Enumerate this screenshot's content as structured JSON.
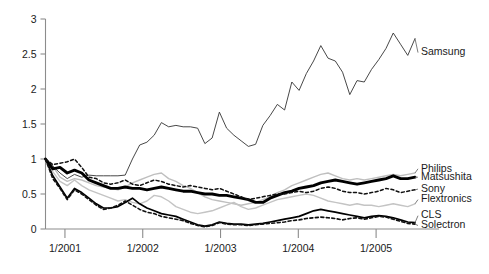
{
  "chart_data": {
    "type": "line",
    "title": "",
    "subtitle": "",
    "xlabel": "",
    "ylabel": "",
    "xlim": [
      "10/2000",
      "7/2005"
    ],
    "ylim": [
      0,
      3
    ],
    "grid": false,
    "legend_position": "right-inline-labels",
    "x_tick_labels": [
      "1/2001",
      "1/2002",
      "1/2003",
      "1/2004",
      "1/2005"
    ],
    "x_tick_values": [
      0.25,
      1.25,
      2.25,
      3.25,
      4.25
    ],
    "y_tick_labels": [
      "0",
      "0.5",
      "1",
      "1.5",
      "2",
      "2.5",
      "3"
    ],
    "y_tick_values": [
      0,
      0.5,
      1,
      1.5,
      2,
      2.5,
      3
    ],
    "x_start": 0,
    "x_end": 4.75,
    "note": "Indexed share price, normalized to 1.0 at start (late 2000). Monthly observations.",
    "series": [
      {
        "name": "Samsung",
        "label": "Samsung",
        "style": "thin-solid",
        "color": "#333333",
        "width": 0.9,
        "dash": "none",
        "label_y": 2.52,
        "values": [
          1.0,
          0.9,
          0.8,
          0.72,
          0.78,
          0.74,
          0.77,
          0.76,
          0.76,
          0.76,
          0.76,
          0.77,
          1.0,
          1.2,
          1.24,
          1.34,
          1.52,
          1.46,
          1.48,
          1.46,
          1.46,
          1.44,
          1.22,
          1.3,
          1.67,
          1.44,
          1.34,
          1.26,
          1.18,
          1.21,
          1.48,
          1.62,
          1.78,
          1.7,
          2.1,
          1.98,
          2.22,
          2.4,
          2.62,
          2.44,
          2.4,
          2.24,
          1.92,
          2.12,
          2.1,
          2.28,
          2.42,
          2.58,
          2.8,
          2.64,
          2.48,
          2.72
        ]
      },
      {
        "name": "Philips",
        "label": "Philips",
        "style": "light-gray-solid",
        "color": "#bfbfbf",
        "width": 1.4,
        "dash": "none",
        "label_y": 0.86,
        "values": [
          1.0,
          0.9,
          0.74,
          0.68,
          0.72,
          0.7,
          0.66,
          0.62,
          0.6,
          0.58,
          0.56,
          0.6,
          0.66,
          0.7,
          0.74,
          0.78,
          0.8,
          0.72,
          0.68,
          0.62,
          0.58,
          0.52,
          0.46,
          0.42,
          0.4,
          0.38,
          0.36,
          0.34,
          0.36,
          0.38,
          0.42,
          0.46,
          0.52,
          0.56,
          0.62,
          0.66,
          0.7,
          0.74,
          0.78,
          0.8,
          0.76,
          0.72,
          0.7,
          0.72,
          0.7,
          0.72,
          0.74,
          0.76,
          0.78,
          0.76,
          0.78,
          0.8
        ]
      },
      {
        "name": "Matsushita",
        "label": "Matsushita",
        "style": "thick-black-solid",
        "color": "#000000",
        "width": 2.9,
        "dash": "none",
        "label_y": 0.74,
        "values": [
          1.0,
          0.86,
          0.88,
          0.8,
          0.84,
          0.8,
          0.7,
          0.66,
          0.62,
          0.58,
          0.58,
          0.6,
          0.58,
          0.58,
          0.56,
          0.58,
          0.6,
          0.58,
          0.56,
          0.54,
          0.54,
          0.52,
          0.5,
          0.5,
          0.48,
          0.48,
          0.46,
          0.44,
          0.42,
          0.38,
          0.38,
          0.44,
          0.48,
          0.52,
          0.54,
          0.58,
          0.6,
          0.62,
          0.66,
          0.68,
          0.7,
          0.68,
          0.66,
          0.64,
          0.66,
          0.68,
          0.7,
          0.72,
          0.76,
          0.72,
          0.72,
          0.74
        ]
      },
      {
        "name": "Sony",
        "label": "Sony",
        "style": "black-dashed",
        "color": "#111111",
        "width": 1.5,
        "dash": "3,2.5",
        "label_y": 0.57,
        "values": [
          1.0,
          0.92,
          0.94,
          0.96,
          1.0,
          0.88,
          0.74,
          0.72,
          0.66,
          0.64,
          0.66,
          0.7,
          0.64,
          0.62,
          0.66,
          0.7,
          0.68,
          0.64,
          0.62,
          0.6,
          0.62,
          0.6,
          0.58,
          0.56,
          0.58,
          0.54,
          0.5,
          0.46,
          0.42,
          0.44,
          0.46,
          0.48,
          0.5,
          0.5,
          0.52,
          0.54,
          0.52,
          0.54,
          0.58,
          0.6,
          0.58,
          0.54,
          0.52,
          0.52,
          0.5,
          0.52,
          0.54,
          0.58,
          0.56,
          0.52,
          0.54,
          0.56
        ]
      },
      {
        "name": "Flextronics",
        "label": "Flextronics",
        "style": "light-gray-solid",
        "color": "#c4c4c4",
        "width": 1.4,
        "dash": "none",
        "label_y": 0.42,
        "values": [
          1.0,
          0.82,
          0.68,
          0.62,
          0.7,
          0.62,
          0.56,
          0.52,
          0.48,
          0.44,
          0.4,
          0.42,
          0.38,
          0.36,
          0.4,
          0.48,
          0.46,
          0.4,
          0.32,
          0.28,
          0.24,
          0.22,
          0.24,
          0.26,
          0.3,
          0.34,
          0.38,
          0.32,
          0.28,
          0.3,
          0.34,
          0.38,
          0.42,
          0.44,
          0.46,
          0.48,
          0.5,
          0.48,
          0.44,
          0.4,
          0.38,
          0.36,
          0.34,
          0.36,
          0.34,
          0.34,
          0.32,
          0.34,
          0.36,
          0.34,
          0.32,
          0.36
        ]
      },
      {
        "name": "CLS",
        "label": "CLS",
        "style": "black-solid",
        "color": "#000000",
        "width": 1.7,
        "dash": "none",
        "label_y": 0.19,
        "values": [
          1.0,
          0.76,
          0.6,
          0.44,
          0.58,
          0.52,
          0.44,
          0.36,
          0.3,
          0.3,
          0.32,
          0.38,
          0.44,
          0.36,
          0.3,
          0.26,
          0.22,
          0.2,
          0.18,
          0.14,
          0.1,
          0.06,
          0.04,
          0.06,
          0.1,
          0.08,
          0.07,
          0.07,
          0.06,
          0.07,
          0.08,
          0.1,
          0.12,
          0.14,
          0.16,
          0.18,
          0.22,
          0.26,
          0.28,
          0.26,
          0.24,
          0.22,
          0.2,
          0.18,
          0.16,
          0.18,
          0.19,
          0.18,
          0.16,
          0.13,
          0.1,
          0.09
        ]
      },
      {
        "name": "Solectron",
        "label": "Solectron",
        "style": "black-dashed",
        "color": "#111111",
        "width": 1.6,
        "dash": "3,2.5",
        "label_y": 0.05,
        "values": [
          1.0,
          0.72,
          0.58,
          0.42,
          0.56,
          0.5,
          0.42,
          0.34,
          0.28,
          0.3,
          0.34,
          0.4,
          0.34,
          0.28,
          0.24,
          0.22,
          0.18,
          0.16,
          0.14,
          0.12,
          0.08,
          0.05,
          0.03,
          0.05,
          0.09,
          0.07,
          0.06,
          0.06,
          0.05,
          0.06,
          0.07,
          0.08,
          0.09,
          0.1,
          0.12,
          0.13,
          0.15,
          0.16,
          0.17,
          0.16,
          0.15,
          0.13,
          0.15,
          0.16,
          0.14,
          0.16,
          0.18,
          0.17,
          0.14,
          0.11,
          0.08,
          0.07
        ]
      }
    ]
  }
}
